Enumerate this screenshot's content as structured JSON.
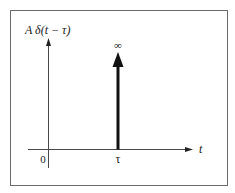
{
  "diagram": {
    "type": "impulse-function-plot",
    "y_label": "A δ(t − τ)",
    "x_label": "t",
    "origin_label": "0",
    "impulse_position_label": "τ",
    "impulse_amplitude_label": "∞",
    "colors": {
      "frame": "#6b6b6b",
      "axes": "#4a4a4a",
      "impulse": "#111111",
      "text": "#1a1a1a",
      "background": "#ffffff"
    }
  }
}
